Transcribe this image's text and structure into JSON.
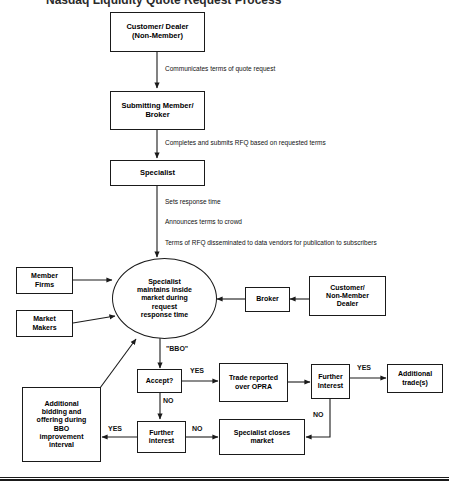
{
  "document": {
    "title_partial": "Nasdaq Liquidity Quote Request Process",
    "bottom_rule_visible": true
  },
  "nodes": {
    "customer_dealer": {
      "line1": "Customer/ Dealer",
      "line2": "(Non-Member)"
    },
    "submitting_member": {
      "line1": "Submitting Member/",
      "line2": "Broker"
    },
    "specialist": {
      "line1": "Specialist"
    },
    "member_firms": {
      "line1": "Member",
      "line2": "Firms"
    },
    "market_makers": {
      "line1": "Market",
      "line2": "Makers"
    },
    "central_oval": {
      "line1": "Specialist",
      "line2": "maintains inside",
      "line3": "market during",
      "line4": "request",
      "line5": "response time"
    },
    "broker": {
      "line1": "Broker"
    },
    "customer_non_member_dealer": {
      "line1": "Customer/",
      "line2": "Non-Member",
      "line3": "Dealer"
    },
    "accept_decision": {
      "line1": "Accept?"
    },
    "trade_reported": {
      "line1": "Trade reported",
      "line2": "over OPRA"
    },
    "further_interest_top": {
      "line1": "Further",
      "line2": "Interest"
    },
    "additional_trades": {
      "line1": "Additional",
      "line2": "trade(s)"
    },
    "further_interest_bottom": {
      "line1": "Further",
      "line2": "interest"
    },
    "specialist_closes": {
      "line1": "Specialist closes",
      "line2": "market"
    },
    "additional_bidding": {
      "line1": "Additional",
      "line2": "bidding and",
      "line3": "offering during",
      "line4": "BBO",
      "line5": "improvement",
      "line6": "interval"
    }
  },
  "edge_labels": {
    "communicates_terms": "Communicates terms of quote request",
    "completes_submits": "Completes and submits RFQ based on requested terms",
    "sets_response_time": "Sets response time",
    "announces_terms": "Announces terms to crowd",
    "terms_disseminated": "Terms of RFQ disseminated to data vendors for publication to subscribers",
    "bbo": "\"BBO\"",
    "accept_yes": "YES",
    "accept_no": "NO",
    "further_top_yes": "YES",
    "further_top_no": "NO",
    "further_bottom_yes": "YES",
    "further_bottom_no": "NO"
  },
  "colors": {
    "stroke": "#1a1a1a",
    "text": "#000000",
    "background": "#ffffff"
  }
}
